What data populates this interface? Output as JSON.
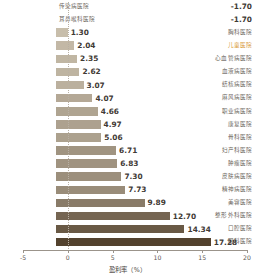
{
  "chart_data": {
    "type": "bar",
    "orientation": "horizontal",
    "title": "",
    "xlabel": "盈利率（%）",
    "ylabel": "",
    "xlim": [
      -5,
      20
    ],
    "xticks": [
      -5,
      0,
      5,
      10,
      15,
      20
    ],
    "xtick_labels": [
      "-5",
      "0",
      "5",
      "10",
      "15",
      "20"
    ],
    "grid": false,
    "zero_line": true,
    "legend": "none",
    "highlight_category": "儿童医院",
    "highlight_color": "#d89a3a",
    "colors": {
      "bar_min": "#ded5c3",
      "bar_max": "#53422e",
      "axis": "#9b948b",
      "label_text": "#6d6760",
      "value_text": "#3f3a35"
    },
    "categories": [
      "传染病医院",
      "耳鼻喉科医院",
      "胸科医院",
      "儿童医院",
      "心血管病医院",
      "血液病医院",
      "结核病医院",
      "麻风病医院",
      "职业病医院",
      "康复医院",
      "骨科医院",
      "妇产科医院",
      "肿瘤医院",
      "皮肤病医院",
      "精神病医院",
      "美容医院",
      "整形外科医院",
      "口腔医院",
      "眼科医院"
    ],
    "values": [
      -1.7,
      -1.7,
      1.3,
      2.04,
      2.35,
      2.62,
      3.07,
      4.07,
      4.66,
      4.97,
      5.06,
      6.71,
      6.83,
      7.3,
      7.73,
      9.89,
      12.7,
      14.34,
      17.28
    ],
    "value_labels": [
      "-1.70",
      "-1.70",
      "1.30",
      "2.04",
      "2.35",
      "2.62",
      "3.07",
      "4.07",
      "4.66",
      "4.97",
      "5.06",
      "6.71",
      "6.83",
      "7.30",
      "7.73",
      "9.89",
      "12.70",
      "14.34",
      "17.28"
    ]
  }
}
